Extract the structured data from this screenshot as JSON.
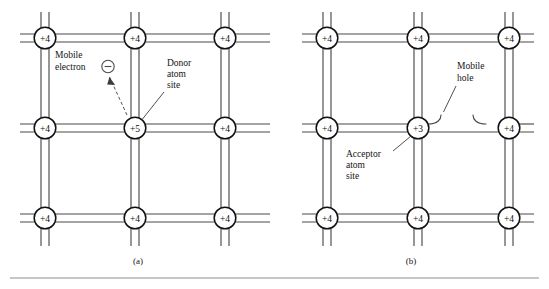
{
  "figure": {
    "rule_color": "#8d8d8d"
  },
  "panels": [
    {
      "id": "a",
      "caption": "(a)",
      "center_node": "+5",
      "lattice_label": "+4",
      "nodes": [
        {
          "row": 0,
          "col": 0,
          "label": "+4"
        },
        {
          "row": 0,
          "col": 1,
          "label": "+4"
        },
        {
          "row": 0,
          "col": 2,
          "label": "+4"
        },
        {
          "row": 1,
          "col": 0,
          "label": "+4"
        },
        {
          "row": 1,
          "col": 1,
          "label": "+5"
        },
        {
          "row": 1,
          "col": 2,
          "label": "+4"
        },
        {
          "row": 2,
          "col": 0,
          "label": "+4"
        },
        {
          "row": 2,
          "col": 1,
          "label": "+4"
        },
        {
          "row": 2,
          "col": 2,
          "label": "+4"
        }
      ],
      "annotations": {
        "carrier_label_line1": "Mobile",
        "carrier_label_line2": "electron",
        "carrier_symbol": "−",
        "site_label_line1": "Donor",
        "site_label_line2": "atom",
        "site_label_line3": "site"
      }
    },
    {
      "id": "b",
      "caption": "(b)",
      "center_node": "+3",
      "lattice_label": "+4",
      "nodes": [
        {
          "row": 0,
          "col": 0,
          "label": "+4"
        },
        {
          "row": 0,
          "col": 1,
          "label": "+4"
        },
        {
          "row": 0,
          "col": 2,
          "label": "+4"
        },
        {
          "row": 1,
          "col": 0,
          "label": "+4"
        },
        {
          "row": 1,
          "col": 1,
          "label": "+3"
        },
        {
          "row": 1,
          "col": 2,
          "label": "+4"
        },
        {
          "row": 2,
          "col": 0,
          "label": "+4"
        },
        {
          "row": 2,
          "col": 1,
          "label": "+4"
        },
        {
          "row": 2,
          "col": 2,
          "label": "+4"
        }
      ],
      "annotations": {
        "carrier_label_line1": "Mobile",
        "carrier_label_line2": "hole",
        "site_label_line1": "Acceptor",
        "site_label_line2": "atom",
        "site_label_line3": "site"
      }
    }
  ]
}
